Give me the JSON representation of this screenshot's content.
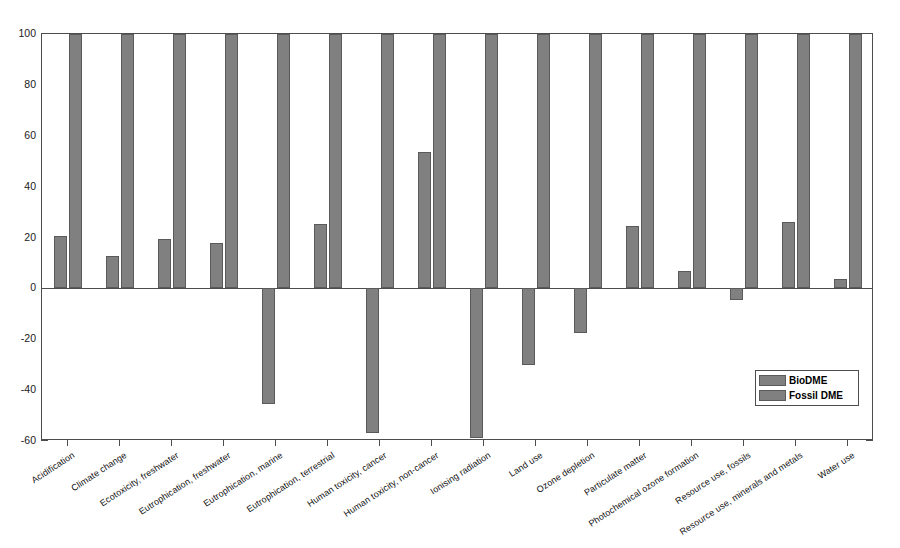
{
  "chart_data": {
    "type": "bar",
    "title": "",
    "subtitle": "",
    "xlabel": "",
    "ylabel": "",
    "ylim": [
      -60,
      100
    ],
    "yticks": [
      100,
      80,
      60,
      40,
      20,
      0,
      -20,
      -40,
      -60
    ],
    "ytick_labels": [
      "100",
      "80",
      "60",
      "40",
      "20",
      "0",
      "-20",
      "-40",
      "-60"
    ],
    "grid": false,
    "legend_position": "lower right",
    "clipped_note": "Fossil DME bars are all at 100 (clipped at axis maximum)",
    "categories": [
      "Acidification",
      "Climate change",
      "Ecotoxicity, freshwater",
      "Eutrophication, freshwater",
      "Eutrophication, marine",
      "Eutrophication, terrestrial",
      "Human toxicity, cancer",
      "Human toxicity, non-cancer",
      "Ionising radiation",
      "Land use",
      "Ozone depletion",
      "Particulate matter",
      "Photochemical ozone formation",
      "Resource use, fossils",
      "Resource use, minerals and metals",
      "Water use"
    ],
    "series": [
      {
        "name": "BioDME",
        "color": "#808080",
        "values": [
          20.5,
          12.8,
          19.3,
          18.0,
          -45.5,
          25.2,
          -57.0,
          53.8,
          -59.0,
          -30.0,
          -17.5,
          24.5,
          7.0,
          -4.5,
          26.0,
          3.5
        ]
      },
      {
        "name": "Fossil DME",
        "color": "#808080",
        "values": [
          100,
          100,
          100,
          100,
          100,
          100,
          100,
          100,
          100,
          100,
          100,
          100,
          100,
          100,
          100,
          100
        ]
      }
    ]
  },
  "legend": {
    "entries": [
      {
        "label": "BioDME"
      },
      {
        "label": "Fossil DME"
      }
    ]
  },
  "colors": {
    "bar_fill": "#808080",
    "bar_edge": "#5a5a5a",
    "axis": "#4d4d4d",
    "background": "#ffffff",
    "text": "#111111"
  }
}
